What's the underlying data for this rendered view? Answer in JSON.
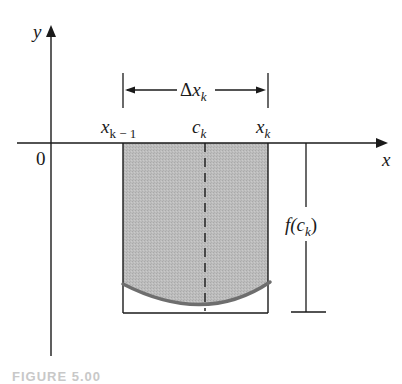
{
  "figure": {
    "axes": {
      "x_label": "x",
      "y_label": "y",
      "origin_label": "0"
    },
    "points": {
      "left": {
        "base": "x",
        "sub": "k − 1"
      },
      "mid": {
        "base": "c",
        "sub": "k"
      },
      "right": {
        "base": "x",
        "sub": "k"
      }
    },
    "width_label": {
      "prefix": "Δ",
      "base": "x",
      "sub": "k"
    },
    "height_label": {
      "pre": "f(",
      "base": "c",
      "sub": "k",
      "post": ")"
    },
    "caption": "FIGURE 5.00",
    "colors": {
      "shade": "#b8b8b8",
      "curve": "#6e6e6e",
      "line": "#1a1a1a"
    }
  }
}
